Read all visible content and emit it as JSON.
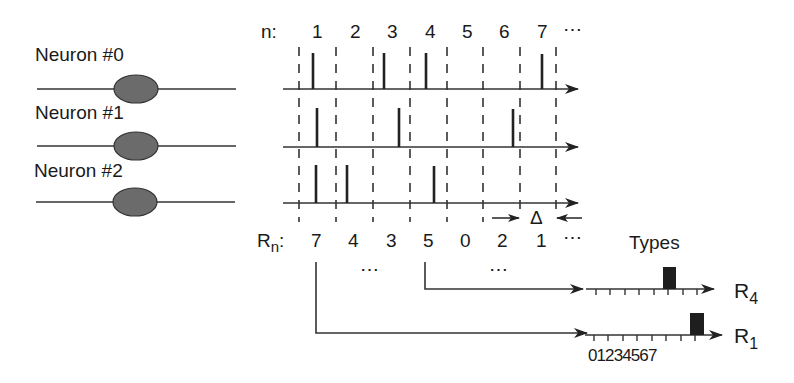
{
  "diagram": {
    "neurons": [
      {
        "label": "Neuron #0",
        "spike_times": [
          313,
          384,
          426,
          542
        ]
      },
      {
        "label": "Neuron #1",
        "spike_times": [
          317,
          399,
          513
        ]
      },
      {
        "label": "Neuron #2",
        "spike_times": [
          316,
          347,
          434
        ]
      }
    ],
    "n_label": "n:",
    "n_values": [
      "1",
      "2",
      "3",
      "4",
      "5",
      "6",
      "7"
    ],
    "n_ellipsis": "⋯",
    "rn_label_main": "R",
    "rn_label_sub": "n",
    "rn_label_colon": ":",
    "rn_values": [
      "7",
      "4",
      "3",
      "5",
      "0",
      "2",
      "1"
    ],
    "rn_ellipsis": "⋯",
    "between_ellipsis_1": "⋯",
    "between_ellipsis_2": "⋯",
    "delta_label": "Δ",
    "types_label": "Types",
    "histograms": [
      {
        "name_main": "R",
        "name_sub": "4",
        "active_type": 5
      },
      {
        "name_main": "R",
        "name_sub": "1",
        "active_type": 7
      }
    ],
    "type_ticks": [
      "0",
      "1",
      "2",
      "3",
      "4",
      "5",
      "6",
      "7"
    ],
    "type_tick_string": "01234567"
  }
}
